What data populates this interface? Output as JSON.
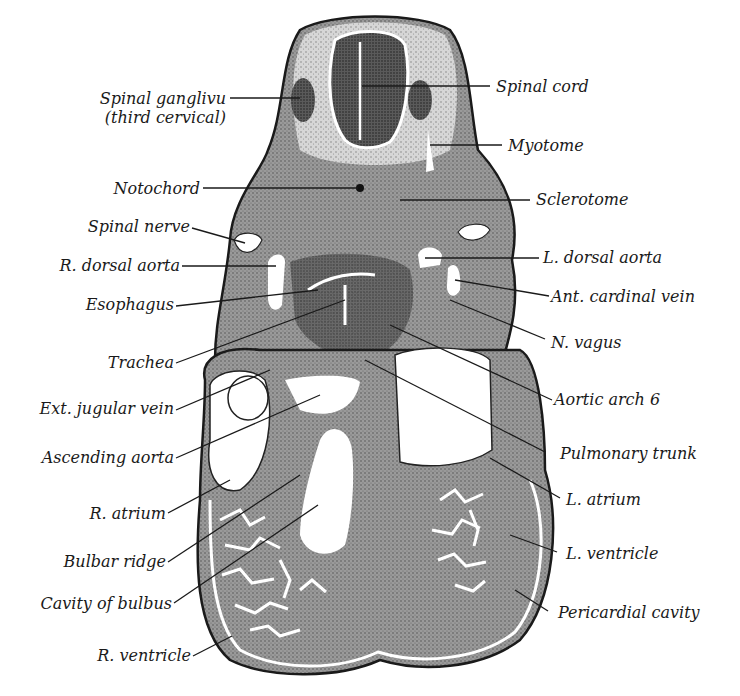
{
  "figure": {
    "ink_color": "#1a1a1a",
    "tissue_color": "#8c8c8c",
    "tissue_dark": "#4a4a4a",
    "background": "#ffffff"
  },
  "labels_left": [
    {
      "id": "spinal-ganglion",
      "text": "Spinal ganglivu",
      "text2": "(third cervical)"
    },
    {
      "id": "notochord",
      "text": "Notochord"
    },
    {
      "id": "spinal-nerve",
      "text": "Spinal nerve"
    },
    {
      "id": "r-dorsal-aorta",
      "text": "R. dorsal aorta"
    },
    {
      "id": "esophagus",
      "text": "Esophagus"
    },
    {
      "id": "trachea",
      "text": "Trachea"
    },
    {
      "id": "ext-jugular-vein",
      "text": "Ext. jugular vein"
    },
    {
      "id": "ascending-aorta",
      "text": "Ascending aorta"
    },
    {
      "id": "r-atrium",
      "text": "R. atrium"
    },
    {
      "id": "bulbar-ridge",
      "text": "Bulbar ridge"
    },
    {
      "id": "cavity-of-bulbus",
      "text": "Cavity of bulbus"
    },
    {
      "id": "r-ventricle",
      "text": "R. ventricle"
    }
  ],
  "labels_right": [
    {
      "id": "spinal-cord",
      "text": "Spinal cord"
    },
    {
      "id": "myotome",
      "text": "Myotome"
    },
    {
      "id": "sclerotome",
      "text": "Sclerotome"
    },
    {
      "id": "l-dorsal-aorta",
      "text": "L. dorsal aorta"
    },
    {
      "id": "ant-cardinal-vein",
      "text": "Ant. cardinal vein"
    },
    {
      "id": "n-vagus",
      "text": "N. vagus"
    },
    {
      "id": "aortic-arch-6",
      "text": "Aortic arch 6"
    },
    {
      "id": "pulmonary-trunk",
      "text": "Pulmonary trunk"
    },
    {
      "id": "l-atrium",
      "text": "L. atrium"
    },
    {
      "id": "l-ventricle",
      "text": "L. ventricle"
    },
    {
      "id": "pericardial-cavity",
      "text": "Pericardial cavity"
    }
  ]
}
